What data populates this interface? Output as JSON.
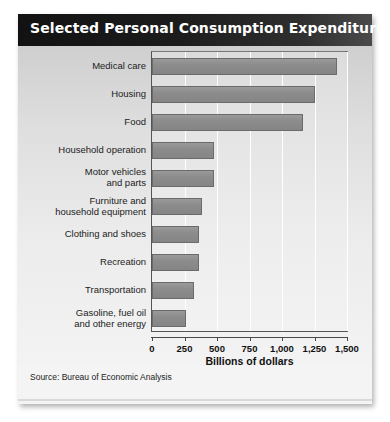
{
  "card": {
    "title": "Selected Personal Consumption Expenditures, 2004",
    "source": "Source: Bureau of Economic Analysis"
  },
  "chart_data": {
    "type": "bar",
    "orientation": "horizontal",
    "title": "Selected Personal Consumption Expenditures, 2004",
    "xlabel": "Billions of dollars",
    "ylabel": "",
    "xlim": [
      0,
      1500
    ],
    "xticks": [
      0,
      250,
      500,
      750,
      1000,
      1250,
      1500
    ],
    "xticklabels": [
      "0",
      "250",
      "500",
      "750",
      "1,000",
      "1,250",
      "1,500"
    ],
    "grid": "vertical",
    "legend": "none",
    "bar_color": "#8c8c8c",
    "categories": [
      "Medical care",
      "Housing",
      "Food",
      "Household operation",
      "Motor vehicles and parts",
      "Furniture and household equipment",
      "Clothing and shoes",
      "Recreation",
      "Transportation",
      "Gasoline, fuel oil and other energy"
    ],
    "category_lines": [
      [
        "Medical care"
      ],
      [
        "Housing"
      ],
      [
        "Food"
      ],
      [
        "Household operation"
      ],
      [
        "Motor vehicles",
        "and parts"
      ],
      [
        "Furniture and",
        "household equipment"
      ],
      [
        "Clothing and shoes"
      ],
      [
        "Recreation"
      ],
      [
        "Transportation"
      ],
      [
        "Gasoline, fuel oil",
        "and other energy"
      ]
    ],
    "values": [
      1425,
      1250,
      1165,
      480,
      478,
      383,
      362,
      360,
      325,
      263
    ]
  }
}
